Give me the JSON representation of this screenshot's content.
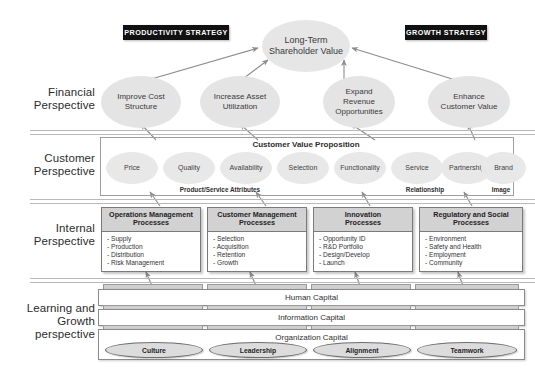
{
  "diagram": {
    "accent_dark": "#111111",
    "ellipse_fill": "#e4e4e4",
    "box_header_fill": "#d2d2d2"
  },
  "banners": {
    "productivity": "PRODUCTIVITY STRATEGY",
    "growth": "GROWTH STRATEGY"
  },
  "perspectives": {
    "financial": "Financial\nPerspective",
    "customer": "Customer\nPerspective",
    "internal": "Internal\nPerspective",
    "learning": "Learning and\nGrowth\nperspective"
  },
  "financial": {
    "apex": "Long-Term\nShareholder Value",
    "objectives": [
      "Improve Cost\nStructure",
      "Increase Asset\nUtilization",
      "Expand\nRevenue\nOpportunities",
      "Enhance\nCustomer Value"
    ]
  },
  "customer": {
    "value_proposition_title": "Customer Value Proposition",
    "attributes": [
      "Price",
      "Quality",
      "Availability",
      "Selection",
      "Functionality",
      "Service",
      "Partnership",
      "Brand"
    ],
    "groups": [
      "Product/Service Attributes",
      "Relationship",
      "Image"
    ]
  },
  "internal": {
    "processes": [
      {
        "title": "Operations Management\nProcesses",
        "items": [
          "- Supply",
          "- Production",
          "- Distribution",
          "- Risk Management"
        ]
      },
      {
        "title": "Customer Management\nProcesses",
        "items": [
          "- Selection",
          "- Acquisition",
          "- Retention",
          "- Growth"
        ]
      },
      {
        "title": "Innovation\nProcesses",
        "items": [
          "- Opportunity ID",
          "- R&D Portfolio",
          "- Design/Develop",
          "- Launch"
        ]
      },
      {
        "title": "Regulatory and Social\nProcesses",
        "items": [
          "- Environment",
          "- Safety and Health",
          "- Employment",
          "- Community"
        ]
      }
    ]
  },
  "learning": {
    "bands": [
      "Human Capital",
      "Information Capital",
      "Organization Capital"
    ],
    "organization_items": [
      "Culture",
      "Leadership",
      "Alignment",
      "Teamwork"
    ]
  }
}
